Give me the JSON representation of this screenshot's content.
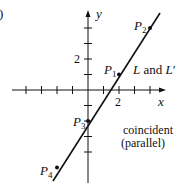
{
  "figure": {
    "part_label": ")",
    "axes": {
      "x_label": "x",
      "y_label": "y",
      "x_tick_label": "2",
      "y_tick_label": "2",
      "origin_px": [
        88,
        90
      ],
      "unit_px": 15.5,
      "x_ticks": [
        -4,
        -3,
        -2,
        -1,
        1,
        2,
        3,
        4,
        5
      ],
      "y_ticks": [
        -4,
        -3,
        -2,
        -1,
        1,
        2,
        3,
        4
      ]
    },
    "line": {
      "label": "L and L'",
      "label_L": "L",
      "label_and": " and ",
      "label_Lp": "L",
      "prime": "′",
      "slope": 1.5,
      "intercept": -2,
      "color": "#111111"
    },
    "points": [
      {
        "name": "P",
        "sub": "1",
        "x": 2,
        "y": 1
      },
      {
        "name": "P",
        "sub": "2",
        "x": 4,
        "y": 4
      },
      {
        "name": "P",
        "sub": "3",
        "x": 0,
        "y": -2
      },
      {
        "name": "P",
        "sub": "4",
        "x": -2,
        "y": -5
      }
    ],
    "annotation": {
      "line1": "coincident",
      "line2": "(parallel)"
    }
  }
}
